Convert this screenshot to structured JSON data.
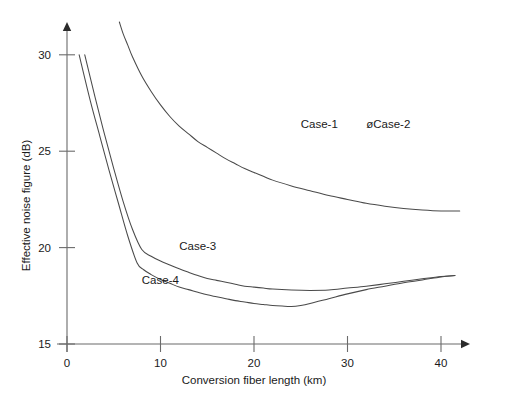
{
  "chart_data": {
    "type": "line",
    "title": "",
    "xlabel": "Conversion fiber length (km)",
    "ylabel": "Effective noise figure (dB)",
    "xlim": [
      0,
      45
    ],
    "ylim": [
      15,
      32.5
    ],
    "xticks": [
      0,
      10,
      20,
      30,
      40
    ],
    "xticklabels": [
      "0",
      "10",
      "20",
      "30",
      "40"
    ],
    "yticks": [
      15,
      20,
      25,
      30
    ],
    "yticklabels": [
      "15",
      "20",
      "25",
      "30"
    ],
    "grid": false,
    "legend_position": "inline-annotations",
    "annotations": [
      {
        "text": "Case-1",
        "x": 25.0,
        "y": 26.2
      },
      {
        "text": "øCase-2",
        "x": 32.0,
        "y": 26.2
      },
      {
        "text": "Case-3",
        "x": 12.0,
        "y": 19.9
      },
      {
        "text": "Case-4",
        "x": 8.0,
        "y": 18.1
      }
    ],
    "series": [
      {
        "name": "Case-1",
        "points": [
          [
            5.6,
            31.7
          ],
          [
            6.0,
            31.1
          ],
          [
            6.5,
            30.5
          ],
          [
            7.0,
            29.9
          ],
          [
            8.0,
            28.9
          ],
          [
            9.0,
            28.1
          ],
          [
            10.0,
            27.4
          ],
          [
            11.0,
            26.8
          ],
          [
            12.0,
            26.3
          ],
          [
            13.0,
            25.9
          ],
          [
            14.0,
            25.5
          ],
          [
            15.0,
            25.2
          ],
          [
            16.0,
            24.9
          ],
          [
            17.0,
            24.6
          ],
          [
            18.0,
            24.35
          ],
          [
            19.0,
            24.1
          ],
          [
            20.0,
            23.9
          ],
          [
            22.0,
            23.5
          ],
          [
            24.0,
            23.2
          ],
          [
            26.0,
            22.95
          ],
          [
            28.0,
            22.7
          ],
          [
            30.0,
            22.5
          ],
          [
            32.0,
            22.3
          ],
          [
            34.0,
            22.15
          ],
          [
            36.0,
            22.03
          ],
          [
            38.0,
            21.95
          ],
          [
            40.0,
            21.9
          ],
          [
            42.0,
            21.9
          ]
        ]
      },
      {
        "name": "Case-2",
        "points": [
          [
            5.6,
            31.7
          ],
          [
            6.0,
            31.1
          ],
          [
            6.5,
            30.5
          ],
          [
            7.0,
            29.9
          ],
          [
            8.0,
            28.9
          ],
          [
            9.0,
            28.1
          ],
          [
            10.0,
            27.4
          ],
          [
            11.0,
            26.8
          ],
          [
            12.0,
            26.3
          ],
          [
            13.0,
            25.9
          ],
          [
            14.0,
            25.5
          ],
          [
            15.0,
            25.2
          ],
          [
            16.0,
            24.9
          ],
          [
            17.0,
            24.6
          ],
          [
            18.0,
            24.35
          ],
          [
            19.0,
            24.1
          ],
          [
            20.0,
            23.9
          ],
          [
            22.0,
            23.5
          ],
          [
            24.0,
            23.2
          ],
          [
            26.0,
            22.95
          ],
          [
            28.0,
            22.7
          ],
          [
            30.0,
            22.5
          ],
          [
            32.0,
            22.3
          ],
          [
            34.0,
            22.15
          ],
          [
            36.0,
            22.03
          ],
          [
            38.0,
            21.95
          ],
          [
            40.0,
            21.9
          ],
          [
            42.0,
            21.9
          ]
        ]
      },
      {
        "name": "Case-3",
        "points": [
          [
            1.9,
            30.0
          ],
          [
            3.0,
            27.8
          ],
          [
            4.0,
            25.9
          ],
          [
            5.0,
            24.1
          ],
          [
            6.0,
            22.4
          ],
          [
            7.0,
            20.95
          ],
          [
            8.0,
            19.9
          ],
          [
            9.0,
            19.55
          ],
          [
            10.0,
            19.3
          ],
          [
            11.0,
            19.1
          ],
          [
            12.0,
            18.9
          ],
          [
            13.0,
            18.72
          ],
          [
            14.0,
            18.55
          ],
          [
            15.0,
            18.4
          ],
          [
            16.0,
            18.3
          ],
          [
            17.0,
            18.2
          ],
          [
            18.0,
            18.1
          ],
          [
            19.0,
            18.0
          ],
          [
            20.0,
            17.95
          ],
          [
            21.0,
            17.9
          ],
          [
            22.0,
            17.85
          ],
          [
            24.0,
            17.8
          ],
          [
            26.0,
            17.78
          ],
          [
            28.0,
            17.8
          ],
          [
            30.0,
            17.9
          ],
          [
            32.0,
            18.0
          ],
          [
            34.0,
            18.12
          ],
          [
            36.0,
            18.25
          ],
          [
            38.0,
            18.38
          ],
          [
            40.0,
            18.5
          ],
          [
            41.5,
            18.55
          ]
        ]
      },
      {
        "name": "Case-4",
        "points": [
          [
            1.3,
            30.0
          ],
          [
            2.5,
            27.6
          ],
          [
            3.5,
            25.8
          ],
          [
            4.5,
            24.0
          ],
          [
            5.5,
            22.3
          ],
          [
            6.5,
            20.6
          ],
          [
            7.5,
            19.2
          ],
          [
            8.2,
            18.85
          ],
          [
            9.0,
            18.6
          ],
          [
            10.0,
            18.35
          ],
          [
            11.0,
            18.15
          ],
          [
            12.0,
            17.95
          ],
          [
            13.0,
            17.82
          ],
          [
            14.0,
            17.68
          ],
          [
            15.0,
            17.55
          ],
          [
            16.0,
            17.45
          ],
          [
            17.0,
            17.35
          ],
          [
            18.0,
            17.25
          ],
          [
            19.0,
            17.18
          ],
          [
            20.0,
            17.1
          ],
          [
            21.0,
            17.05
          ],
          [
            22.0,
            17.0
          ],
          [
            23.0,
            16.97
          ],
          [
            24.0,
            16.95
          ],
          [
            25.0,
            17.0
          ],
          [
            26.0,
            17.1
          ],
          [
            28.0,
            17.35
          ],
          [
            30.0,
            17.6
          ],
          [
            32.0,
            17.82
          ],
          [
            34.0,
            18.0
          ],
          [
            36.0,
            18.18
          ],
          [
            38.0,
            18.32
          ],
          [
            40.0,
            18.48
          ],
          [
            41.5,
            18.55
          ]
        ]
      }
    ]
  }
}
